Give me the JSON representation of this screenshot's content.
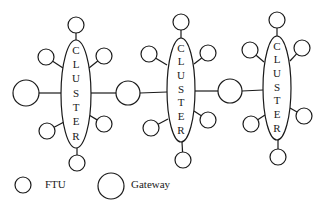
{
  "diagram": {
    "type": "network-topology",
    "stroke_color": "#1a1a1a",
    "background": "#ffffff",
    "cluster_label": "CLUSTER",
    "clusters": [
      {
        "id": "cluster-1",
        "label": "CLUSTER",
        "ellipse": {
          "cx": 76,
          "cy": 94,
          "rx": 15,
          "ry": 54
        },
        "ftus": [
          {
            "pos": "top",
            "cx": 76,
            "cy": 25,
            "r": 8,
            "attach": [
              76,
              40
            ]
          },
          {
            "pos": "upper-left",
            "cx": 46,
            "cy": 57,
            "r": 8,
            "attach": [
              63,
              68
            ]
          },
          {
            "pos": "upper-right",
            "cx": 104,
            "cy": 56,
            "r": 8,
            "attach": [
              89,
              68
            ]
          },
          {
            "pos": "lower-left",
            "cx": 47,
            "cy": 131,
            "r": 8,
            "attach": [
              64,
              122
            ]
          },
          {
            "pos": "lower-right",
            "cx": 104,
            "cy": 124,
            "r": 8,
            "attach": [
              89,
              115
            ]
          },
          {
            "pos": "bottom",
            "cx": 77,
            "cy": 163,
            "r": 8,
            "attach": [
              77,
              148
            ]
          }
        ]
      },
      {
        "id": "cluster-2",
        "label": "CLUSTER",
        "ellipse": {
          "cx": 181,
          "cy": 90,
          "rx": 14,
          "ry": 52
        },
        "ftus": [
          {
            "pos": "top",
            "cx": 181,
            "cy": 22,
            "r": 8,
            "attach": [
              181,
              38
            ]
          },
          {
            "pos": "upper-left",
            "cx": 149,
            "cy": 54,
            "r": 8,
            "attach": [
              167,
              65
            ]
          },
          {
            "pos": "upper-right",
            "cx": 208,
            "cy": 53,
            "r": 8,
            "attach": [
              194,
              64
            ]
          },
          {
            "pos": "lower-left",
            "cx": 151,
            "cy": 128,
            "r": 8,
            "attach": [
              168,
              119
            ]
          },
          {
            "pos": "lower-right",
            "cx": 208,
            "cy": 120,
            "r": 8,
            "attach": [
              194,
              111
            ]
          },
          {
            "pos": "bottom",
            "cx": 183,
            "cy": 160,
            "r": 8,
            "attach": [
              182,
              142
            ]
          }
        ]
      },
      {
        "id": "cluster-3",
        "label": "CLUSTER",
        "ellipse": {
          "cx": 277,
          "cy": 88,
          "rx": 14,
          "ry": 52
        },
        "ftus": [
          {
            "pos": "top",
            "cx": 277,
            "cy": 20,
            "r": 8,
            "attach": [
              277,
              36
            ]
          },
          {
            "pos": "upper-left",
            "cx": 250,
            "cy": 50,
            "r": 8,
            "attach": [
              264,
              62
            ]
          },
          {
            "pos": "upper-right",
            "cx": 302,
            "cy": 48,
            "r": 8,
            "attach": [
              290,
              61
            ]
          },
          {
            "pos": "lower-left",
            "cx": 251,
            "cy": 124,
            "r": 8,
            "attach": [
              265,
              115
            ]
          },
          {
            "pos": "lower-right",
            "cx": 304,
            "cy": 116,
            "r": 8,
            "attach": [
              290,
              108
            ]
          },
          {
            "pos": "bottom",
            "cx": 278,
            "cy": 157,
            "r": 8,
            "attach": [
              278,
              140
            ]
          }
        ]
      }
    ],
    "gateways": [
      {
        "id": "gateway-left",
        "cx": 26,
        "cy": 93,
        "r": 13,
        "links": [
          [
            39,
            93,
            61,
            93
          ]
        ]
      },
      {
        "id": "gateway-1-2",
        "cx": 128,
        "cy": 93,
        "r": 12,
        "links": [
          [
            91,
            93,
            116,
            93
          ],
          [
            140,
            93,
            167,
            92
          ]
        ]
      },
      {
        "id": "gateway-2-3",
        "cx": 230,
        "cy": 91,
        "r": 12,
        "links": [
          [
            195,
            91,
            218,
            91
          ],
          [
            242,
            91,
            263,
            90
          ]
        ]
      }
    ],
    "legend": {
      "items": [
        {
          "label": "FTU",
          "symbol": "small-circle",
          "cx": 23,
          "cy": 185,
          "r": 8,
          "text_x": 45
        },
        {
          "label": "Gateway",
          "symbol": "large-circle",
          "cx": 111,
          "cy": 186,
          "r": 13,
          "text_x": 131
        }
      ]
    }
  }
}
